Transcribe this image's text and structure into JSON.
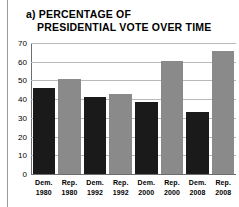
{
  "chart_data": {
    "type": "bar",
    "title": "a) PERCENTAGE OF PRESIDENTIAL VOTE OVER TIME",
    "title_lines": [
      "a) PERCENTAGE OF",
      "PRESIDENTIAL VOTE OVER TIME"
    ],
    "xlabel": "",
    "ylabel": "",
    "ylim": [
      0,
      70
    ],
    "ytick_values": [
      0,
      10,
      20,
      30,
      40,
      50,
      60,
      70
    ],
    "ytick_labels": [
      "0",
      "10",
      "20",
      "30",
      "40",
      "50",
      "60",
      "70"
    ],
    "grid": true,
    "legend": "none",
    "categories": [
      "Dem. 1980",
      "Rep. 1980",
      "Dem. 1992",
      "Rep. 1992",
      "Dem. 2000",
      "Rep. 2000",
      "Dem. 2008",
      "Rep. 2008"
    ],
    "category_parts": [
      {
        "party": "Dem.",
        "year": "1980"
      },
      {
        "party": "Rep.",
        "year": "1980"
      },
      {
        "party": "Dem.",
        "year": "1992"
      },
      {
        "party": "Rep.",
        "year": "1992"
      },
      {
        "party": "Dem.",
        "year": "2000"
      },
      {
        "party": "Rep.",
        "year": "2000"
      },
      {
        "party": "Dem.",
        "year": "2008"
      },
      {
        "party": "Rep.",
        "year": "2008"
      }
    ],
    "values": [
      46,
      51,
      41,
      42.5,
      38.5,
      60.5,
      33,
      65.5
    ],
    "bar_colors": [
      "#1a1a1a",
      "#8a8a8a",
      "#1a1a1a",
      "#8a8a8a",
      "#1a1a1a",
      "#8a8a8a",
      "#1a1a1a",
      "#8a8a8a"
    ]
  },
  "colors": {
    "democrat_bar": "#1a1a1a",
    "republican_bar": "#8a8a8a",
    "gridline": "#b9b9b9",
    "axis": "#6e6e6e",
    "text": "#000000",
    "background": "#ffffff",
    "rule": "#9b9b9b"
  }
}
